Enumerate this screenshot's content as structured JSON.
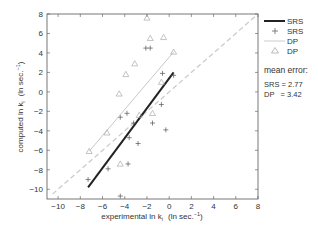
{
  "chart_data": {
    "type": "scatter",
    "title": "",
    "xlabel": "experimental ln k_i  (ln sec.^-1)",
    "ylabel": "computed ln k_i  (ln sec.^-1)",
    "xlim": [
      -11,
      8
    ],
    "ylim": [
      -11,
      8
    ],
    "xticks": [
      -10,
      -8,
      -6,
      -4,
      -2,
      0,
      2,
      4,
      6,
      8
    ],
    "yticks": [
      -10,
      -8,
      -6,
      -4,
      -2,
      0,
      2,
      4,
      6,
      8
    ],
    "grid": false,
    "legend_position": "right-outside",
    "series": [
      {
        "name": "SRS",
        "kind": "fit-line",
        "style": "solid-black-thick",
        "color": "#222222",
        "points": [
          [
            -7.3,
            -9.8
          ],
          [
            0.4,
            2.0
          ]
        ]
      },
      {
        "name": "SRS",
        "kind": "markers",
        "marker": "plus",
        "color": "#555555",
        "points": [
          [
            -2.1,
            4.5
          ],
          [
            -1.7,
            4.5
          ],
          [
            -0.6,
            1.9
          ],
          [
            0.4,
            1.7
          ],
          [
            -3.8,
            -2.2
          ],
          [
            -4.4,
            -2.6
          ],
          [
            -0.7,
            -1.3
          ],
          [
            -1.5,
            -3.2
          ],
          [
            -3.2,
            -3.2
          ],
          [
            -0.3,
            -3.9
          ],
          [
            -3.6,
            -4.7
          ],
          [
            -2.8,
            -5.3
          ],
          [
            -3.7,
            -7.4
          ],
          [
            -5.5,
            -7.9
          ],
          [
            -7.3,
            -9.0
          ],
          [
            -4.4,
            -10.7
          ]
        ]
      },
      {
        "name": "DP",
        "kind": "fit-line",
        "style": "solid-light-gray",
        "color": "#c8c8c8",
        "points": [
          [
            -7.2,
            -6.1
          ],
          [
            0.4,
            4.1
          ]
        ]
      },
      {
        "name": "DP",
        "kind": "markers",
        "marker": "triangle",
        "color": "#aaaaaa",
        "points": [
          [
            -2.0,
            7.6
          ],
          [
            -1.7,
            5.5
          ],
          [
            -0.5,
            5.6
          ],
          [
            0.4,
            4.1
          ],
          [
            -3.1,
            2.9
          ],
          [
            -3.9,
            1.8
          ],
          [
            -0.7,
            1.0
          ],
          [
            -4.5,
            -0.2
          ],
          [
            -2.7,
            -2.4
          ],
          [
            -1.5,
            -2.2
          ],
          [
            -5.6,
            -4.2
          ],
          [
            -7.2,
            -6.1
          ],
          [
            -4.4,
            -7.4
          ]
        ]
      },
      {
        "name": "identity",
        "kind": "reference-line",
        "style": "dashed-light-gray",
        "color": "#cccccc",
        "points": [
          [
            -10.5,
            -10.5
          ],
          [
            8,
            8
          ]
        ]
      }
    ],
    "legend": [
      {
        "label": "SRS",
        "symbol": "line-black"
      },
      {
        "label": "SRS",
        "symbol": "plus"
      },
      {
        "label": "DP",
        "symbol": "line-gray"
      },
      {
        "label": "DP",
        "symbol": "triangle"
      }
    ],
    "annotations": {
      "mean_error_title": "mean error:",
      "lines": [
        "SRS = 2.77",
        "DP   = 3.42"
      ]
    }
  },
  "axes": {
    "xlabel_main": "experimental ln k",
    "xlabel_sub": "i",
    "xlabel_units": "(ln sec.",
    "xlabel_sup": "−1",
    "xlabel_close": ")",
    "ylabel_main": "computed ln k",
    "ylabel_sub": "i",
    "ylabel_units": "(ln sec.",
    "ylabel_sup": "−1",
    "ylabel_close": ")"
  },
  "legend": {
    "items": [
      "SRS",
      "SRS",
      "DP",
      "DP"
    ],
    "mean_error_title": "mean error:",
    "srs_error": "SRS = 2.77",
    "dp_error": "DP   = 3.42"
  }
}
